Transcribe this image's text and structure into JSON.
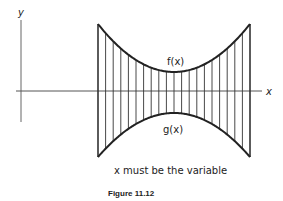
{
  "diagram": {
    "axis_labels": {
      "x": "x",
      "y": "y"
    },
    "curve_labels": {
      "upper": "f(x)",
      "lower": "g(x)"
    },
    "note": "x must be the variable",
    "caption": "Figure 11.12",
    "vertical_strip_count": 21,
    "colors": {
      "stroke": "#222222",
      "background": "#ffffff"
    }
  }
}
